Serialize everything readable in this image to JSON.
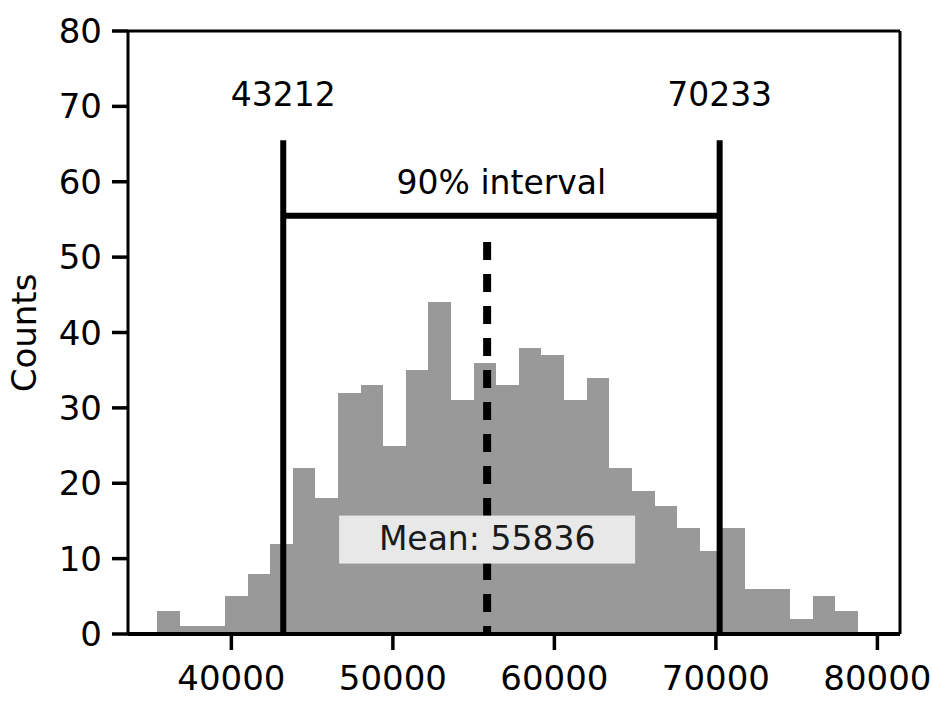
{
  "chart_data": {
    "type": "bar",
    "title": "",
    "xlabel": "",
    "ylabel": "Counts",
    "xlim": [
      33600,
      81400
    ],
    "ylim": [
      0,
      80
    ],
    "grid": false,
    "legend": "none",
    "bar_color": "#999999",
    "bin_width": 1400,
    "x_bin_starts": [
      34000,
      35400,
      36800,
      38200,
      39600,
      41000,
      42400,
      43800,
      45200,
      46600,
      48000,
      49400,
      50800,
      52200,
      53600,
      55000,
      56400,
      57800,
      59200,
      60600,
      62000,
      63400,
      64800,
      66200,
      67600,
      69000,
      70400,
      71800,
      73200,
      74600,
      76000,
      77400,
      78800
    ],
    "values": [
      0,
      3,
      1,
      1,
      5,
      8,
      12,
      22,
      18,
      32,
      33,
      25,
      35,
      44,
      31,
      36,
      33,
      38,
      37,
      31,
      34,
      22,
      19,
      17,
      14,
      11,
      14,
      6,
      6,
      2,
      5,
      3,
      0
    ],
    "xticks": [
      40000,
      50000,
      60000,
      70000,
      80000
    ],
    "xtick_labels": [
      "40000",
      "50000",
      "60000",
      "70000",
      "80000"
    ],
    "yticks": [
      0,
      10,
      20,
      30,
      40,
      50,
      60,
      70,
      80
    ],
    "ytick_labels": [
      "0",
      "10",
      "20",
      "30",
      "40",
      "50",
      "60",
      "70",
      "80"
    ],
    "annotations": {
      "interval_lower_value": 43212,
      "interval_lower_label": "43212",
      "interval_upper_value": 70233,
      "interval_upper_label": "70233",
      "interval_bracket_y": 55.5,
      "interval_line_top_y": 65.5,
      "interval_caption": "90% interval",
      "mean_value": 55836,
      "mean_label": "Mean: 55836",
      "mean_label_bg": "#e8e8e8",
      "mean_line_style": "dashed",
      "line_color": "#000000"
    }
  }
}
